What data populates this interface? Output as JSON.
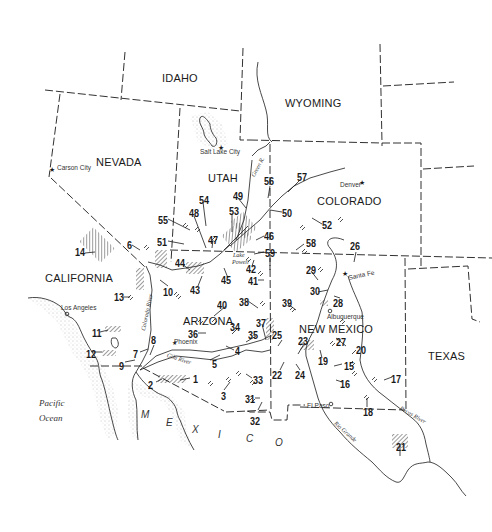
{
  "map": {
    "title": "Southwestern United States site locations",
    "colors": {
      "ink": "#1a1a1a",
      "background": "#ffffff",
      "stipple": "#777777"
    },
    "states": [
      {
        "name": "IDAHO",
        "x": 162,
        "y": 73
      },
      {
        "name": "WYOMING",
        "x": 285,
        "y": 98
      },
      {
        "name": "NEVADA",
        "x": 96,
        "y": 157
      },
      {
        "name": "UTAH",
        "x": 208,
        "y": 173
      },
      {
        "name": "COLORADO",
        "x": 317,
        "y": 196
      },
      {
        "name": "CALIFORNIA",
        "x": 45,
        "y": 273
      },
      {
        "name": "ARIZONA",
        "x": 183,
        "y": 316
      },
      {
        "name": "NEW MEXICO",
        "x": 299,
        "y": 324
      },
      {
        "name": "TEXAS",
        "x": 428,
        "y": 351
      }
    ],
    "cities": [
      {
        "name": "Salt Lake City",
        "x": 200,
        "y": 149,
        "marker": "star"
      },
      {
        "name": "Carson City",
        "x": 57,
        "y": 165,
        "marker": "star"
      },
      {
        "name": "Denver",
        "x": 340,
        "y": 182,
        "marker": "star"
      },
      {
        "name": "Santa Fe",
        "x": 343,
        "y": 276,
        "marker": "star"
      },
      {
        "name": "Albuquerque",
        "x": 327,
        "y": 314,
        "marker": "circle"
      },
      {
        "name": "Los Angeles",
        "x": 61,
        "y": 307,
        "marker": "circle"
      },
      {
        "name": "Phoenix",
        "x": 174,
        "y": 342,
        "marker": "star"
      },
      {
        "name": "El Paso",
        "x": 307,
        "y": 406,
        "marker": "circle"
      }
    ],
    "water_labels": [
      {
        "name": "Pacific",
        "x": 39,
        "y": 399
      },
      {
        "name": "Ocean",
        "x": 39,
        "y": 414
      },
      {
        "name": "Lake",
        "x": 233,
        "y": 252
      },
      {
        "name": "Powell",
        "x": 232,
        "y": 259
      }
    ],
    "river_labels": [
      {
        "name": "Green R.",
        "x": 250,
        "y": 175,
        "rotate": -62
      },
      {
        "name": "Colorado River",
        "x": 138,
        "y": 300,
        "rotate": -78
      },
      {
        "name": "Gila River",
        "x": 175,
        "y": 355,
        "rotate": 18
      },
      {
        "name": "Rio Grande",
        "x": 337,
        "y": 428,
        "rotate": 42
      },
      {
        "name": "Pecos River",
        "x": 405,
        "y": 415,
        "rotate": 30
      }
    ],
    "country_letters": [
      {
        "t": "M",
        "x": 141,
        "y": 410
      },
      {
        "t": "E",
        "x": 166,
        "y": 418
      },
      {
        "t": "X",
        "x": 192,
        "y": 425
      },
      {
        "t": "I",
        "x": 218,
        "y": 430
      },
      {
        "t": "C",
        "x": 246,
        "y": 434
      },
      {
        "t": "O",
        "x": 275,
        "y": 438
      }
    ],
    "sites": [
      {
        "n": "1",
        "x": 193,
        "y": 374
      },
      {
        "n": "2",
        "x": 148,
        "y": 380
      },
      {
        "n": "3",
        "x": 221,
        "y": 391
      },
      {
        "n": "4",
        "x": 235,
        "y": 346
      },
      {
        "n": "5",
        "x": 212,
        "y": 359
      },
      {
        "n": "6",
        "x": 127,
        "y": 240
      },
      {
        "n": "7",
        "x": 133,
        "y": 349
      },
      {
        "n": "8",
        "x": 151,
        "y": 335
      },
      {
        "n": "9",
        "x": 119,
        "y": 361
      },
      {
        "n": "10",
        "x": 163,
        "y": 287
      },
      {
        "n": "11",
        "x": 92,
        "y": 328
      },
      {
        "n": "12",
        "x": 86,
        "y": 349
      },
      {
        "n": "13",
        "x": 114,
        "y": 292
      },
      {
        "n": "14",
        "x": 75,
        "y": 247
      },
      {
        "n": "15",
        "x": 344,
        "y": 361
      },
      {
        "n": "16",
        "x": 340,
        "y": 379
      },
      {
        "n": "17",
        "x": 391,
        "y": 374
      },
      {
        "n": "18",
        "x": 363,
        "y": 407
      },
      {
        "n": "19",
        "x": 318,
        "y": 356
      },
      {
        "n": "20",
        "x": 356,
        "y": 345
      },
      {
        "n": "21",
        "x": 396,
        "y": 442
      },
      {
        "n": "22",
        "x": 272,
        "y": 370
      },
      {
        "n": "23",
        "x": 298,
        "y": 336
      },
      {
        "n": "24",
        "x": 295,
        "y": 370
      },
      {
        "n": "25",
        "x": 272,
        "y": 330
      },
      {
        "n": "26",
        "x": 350,
        "y": 241
      },
      {
        "n": "27",
        "x": 336,
        "y": 337
      },
      {
        "n": "28",
        "x": 333,
        "y": 298
      },
      {
        "n": "29",
        "x": 306,
        "y": 265
      },
      {
        "n": "30",
        "x": 310,
        "y": 286
      },
      {
        "n": "31",
        "x": 245,
        "y": 394
      },
      {
        "n": "32",
        "x": 250,
        "y": 416
      },
      {
        "n": "33",
        "x": 253,
        "y": 375
      },
      {
        "n": "34",
        "x": 230,
        "y": 322
      },
      {
        "n": "35",
        "x": 248,
        "y": 330
      },
      {
        "n": "36",
        "x": 188,
        "y": 329
      },
      {
        "n": "37",
        "x": 256,
        "y": 318
      },
      {
        "n": "38",
        "x": 239,
        "y": 297
      },
      {
        "n": "39",
        "x": 282,
        "y": 298
      },
      {
        "n": "40",
        "x": 217,
        "y": 300
      },
      {
        "n": "41",
        "x": 248,
        "y": 276
      },
      {
        "n": "42",
        "x": 246,
        "y": 264
      },
      {
        "n": "43",
        "x": 190,
        "y": 285
      },
      {
        "n": "44",
        "x": 175,
        "y": 258
      },
      {
        "n": "45",
        "x": 221,
        "y": 275
      },
      {
        "n": "46",
        "x": 264,
        "y": 231
      },
      {
        "n": "47",
        "x": 208,
        "y": 235
      },
      {
        "n": "48",
        "x": 189,
        "y": 208
      },
      {
        "n": "49",
        "x": 233,
        "y": 191
      },
      {
        "n": "50",
        "x": 282,
        "y": 208
      },
      {
        "n": "51",
        "x": 157,
        "y": 237
      },
      {
        "n": "52",
        "x": 322,
        "y": 220
      },
      {
        "n": "53",
        "x": 229,
        "y": 206
      },
      {
        "n": "54",
        "x": 199,
        "y": 195
      },
      {
        "n": "55",
        "x": 158,
        "y": 215
      },
      {
        "n": "56",
        "x": 264,
        "y": 176
      },
      {
        "n": "57",
        "x": 297,
        "y": 172
      },
      {
        "n": "58",
        "x": 306,
        "y": 238
      },
      {
        "n": "59",
        "x": 265,
        "y": 248
      }
    ]
  }
}
